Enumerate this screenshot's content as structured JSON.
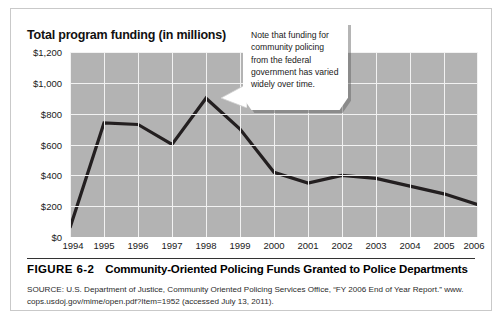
{
  "figure": {
    "number_label": "FIGURE 6-2",
    "caption": "Community-Oriented Policing Funds Granted to Police Departments",
    "source_line1": "SOURCE: U.S. Department of Justice, Community Oriented Policing Services Office, “FY 2006 End of Year Report.” www.",
    "source_line2": "cops.usdoj.gov/mime/open.pdf?Item=1952 (accessed July 13, 2011)."
  },
  "callout": {
    "text": "Note that funding for community policing from the federal government has varied widely over time."
  },
  "chart_data": {
    "type": "line",
    "title": "Total program funding (in millions)",
    "xlabel": "",
    "ylabel": "Total program funding (in millions)",
    "categories": [
      "1994",
      "1995",
      "1996",
      "1997",
      "1998",
      "1999",
      "2000",
      "2001",
      "2002",
      "2003",
      "2004",
      "2005",
      "2006"
    ],
    "values": [
      60,
      740,
      730,
      600,
      900,
      700,
      420,
      350,
      400,
      380,
      330,
      280,
      210
    ],
    "series": [
      {
        "name": "Total program funding",
        "values": [
          60,
          740,
          730,
          600,
          900,
          700,
          420,
          350,
          400,
          380,
          330,
          280,
          210
        ]
      }
    ],
    "ylim": [
      0,
      1200
    ],
    "ytick_values": [
      0,
      200,
      400,
      600,
      800,
      1000,
      1200
    ],
    "ytick_labels": [
      "$0",
      "$200",
      "$400",
      "$600",
      "$800",
      "$1,000",
      "$1,200"
    ],
    "grid": true,
    "legend": "none",
    "plot_background_color": "#b3b3b3",
    "gridline_color": "#f2f2f2",
    "line_color": "#231f20",
    "units": "millions of dollars"
  }
}
